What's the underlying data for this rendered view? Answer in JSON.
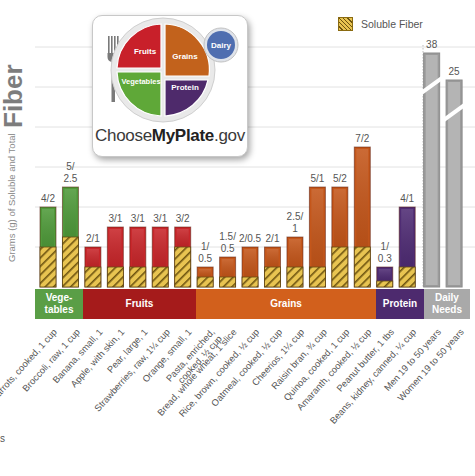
{
  "chart_data": {
    "type": "bar",
    "title": "",
    "ylabel": "Grams (g) of Soluble and Total Fiber",
    "ylabel_small": "Grams (g) of Soluble and Total",
    "ylabel_big": "Fiber",
    "ylim": [
      0,
      12
    ],
    "grid": true,
    "axis_break_above": 11,
    "legend": {
      "position": "top-right",
      "entries": [
        {
          "name": "Soluble Fiber",
          "pattern": "hatched-yellow"
        }
      ]
    },
    "categories": [
      "Carrots, cooked, 1 cup",
      "Broccoli, raw, 1 cup",
      "Banana, small, 1",
      "Apple, with skin, 1",
      "Pear, large, 1",
      "Strawberries, raw, 1¼ cup",
      "Orange, small, 1",
      "Pasta, enriched, cooked, ½ cup",
      "Bread, whole wheat, 1 slice",
      "Rice, brown, cooked, ½ cup",
      "Oatmeal, cooked, ½ cup",
      "Cheerios, 1¼ cup",
      "Raisin bran, ¾ cup",
      "Quinoa, cooked, 1 cup",
      "Amaranth, cooked, ½ cup",
      "Peanut butter, 1 tbs",
      "Beans, kidney, canned, ¼ cup",
      "Men 19 to 50 years",
      "Women 19 to 50 years"
    ],
    "groups_per_category": [
      "vegetables",
      "vegetables",
      "fruits",
      "fruits",
      "fruits",
      "fruits",
      "fruits",
      "grains",
      "grains",
      "grains",
      "grains",
      "grains",
      "grains",
      "grains",
      "grains",
      "protein",
      "protein",
      "daily",
      "daily"
    ],
    "series": [
      {
        "name": "Total Fiber",
        "values": [
          4,
          5,
          2,
          3,
          3,
          3,
          3,
          1,
          1.5,
          2,
          2,
          2.5,
          5,
          5,
          7,
          1,
          4,
          38,
          25
        ]
      },
      {
        "name": "Soluble Fiber",
        "values": [
          2,
          2.5,
          1,
          1,
          1,
          1,
          2,
          0.5,
          0.5,
          0.5,
          1,
          1,
          1,
          2,
          2,
          0.3,
          1,
          null,
          null
        ]
      }
    ],
    "data_labels": [
      [
        "4/2"
      ],
      [
        "5/",
        "2.5"
      ],
      [
        "2/1"
      ],
      [
        "3/1"
      ],
      [
        "3/1"
      ],
      [
        "3/1"
      ],
      [
        "3/2"
      ],
      [
        "1/",
        "0.5"
      ],
      [
        "1.5/",
        "0.5"
      ],
      [
        "2/0.5"
      ],
      [
        "2/1"
      ],
      [
        "2.5/",
        "1"
      ],
      [
        "5/1"
      ],
      [
        "5/2"
      ],
      [
        "7/2"
      ],
      [
        "1/",
        "0.3"
      ],
      [
        "4/1"
      ],
      [
        "38"
      ],
      [
        "25"
      ]
    ]
  },
  "groups": [
    {
      "key": "vegetables",
      "label_lines": [
        "Vege-",
        "tables"
      ],
      "color": "#5a9e46"
    },
    {
      "key": "fruits",
      "label_lines": [
        "Fruits"
      ],
      "color": "#a51b1b"
    },
    {
      "key": "grains",
      "label_lines": [
        "Grains"
      ],
      "color": "#d2601c"
    },
    {
      "key": "protein",
      "label_lines": [
        "Protein"
      ],
      "color": "#4d2a6e"
    },
    {
      "key": "daily",
      "label_lines": [
        "Daily",
        "Needs"
      ],
      "color": "#a9a9a9"
    }
  ],
  "bar_colors": {
    "vegetables": "#4f9a3a",
    "fruits": "#c8262a",
    "grains": "#c4561a",
    "protein": "#4f2c74",
    "daily": "#9a9a9a",
    "soluble_light": "#e8c451",
    "soluble_dark": "#6d5410"
  },
  "plate": {
    "sections": [
      "Fruits",
      "Grains",
      "Vegetables",
      "Protein"
    ],
    "dairy": "Dairy",
    "brand_prefix": "Choose",
    "brand_bold": "MyPlate",
    "brand_suffix": ".gov",
    "colors": {
      "fruits": "#c8202a",
      "grains": "#c2621c",
      "vegetables": "#5fa838",
      "protein": "#4e2a6b",
      "dairy": "#4f6eb0"
    }
  },
  "stray_text": "s"
}
